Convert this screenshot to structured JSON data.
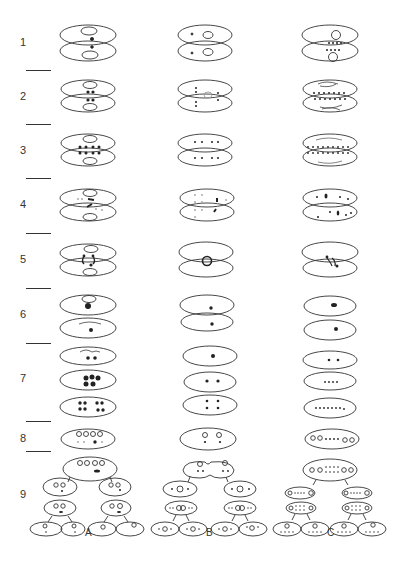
{
  "diagram": {
    "row_labels": [
      "1",
      "2",
      "3",
      "4",
      "5",
      "6",
      "7",
      "8",
      "9"
    ],
    "column_labels": [
      "A",
      "B",
      "C"
    ]
  }
}
